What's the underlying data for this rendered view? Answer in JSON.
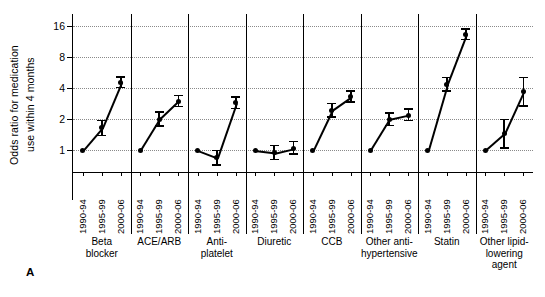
{
  "panel": {
    "letter": "A"
  },
  "chart_data": {
    "type": "line",
    "title": "",
    "xlabel": "",
    "ylabel": "Odds ratio for medication use within 4 months",
    "ylabel_lines": [
      "Odds ratio for medication",
      "use within 4 months"
    ],
    "yscale": "log",
    "ylim": [
      0.62,
      19.0
    ],
    "yticks": [
      1,
      2,
      4,
      8,
      16
    ],
    "ytick_labels": [
      "1",
      "2",
      "4",
      "8",
      "16"
    ],
    "grid": "horizontal-dotted",
    "legend": "none",
    "periods": [
      "1990-94",
      "1995-99",
      "2000-06"
    ],
    "reference_value": 1,
    "groups": [
      {
        "label": "Beta blocker",
        "label_lines": [
          "Beta",
          "blocker"
        ],
        "points": [
          {
            "period": "1990-94",
            "value": 1.0,
            "low": 1.0,
            "high": 1.0
          },
          {
            "period": "1995-99",
            "value": 1.65,
            "low": 1.4,
            "high": 1.95
          },
          {
            "period": "2000-06",
            "value": 4.55,
            "low": 4.05,
            "high": 5.15
          }
        ]
      },
      {
        "label": "ACE/ARB",
        "label_lines": [
          "ACE/ARB"
        ],
        "points": [
          {
            "period": "1990-94",
            "value": 1.0,
            "low": 1.0,
            "high": 1.0
          },
          {
            "period": "1995-99",
            "value": 2.0,
            "low": 1.72,
            "high": 2.35
          },
          {
            "period": "2000-06",
            "value": 3.0,
            "low": 2.65,
            "high": 3.4
          }
        ]
      },
      {
        "label": "Anti-platelet",
        "label_lines": [
          "Anti-",
          "platelet"
        ],
        "points": [
          {
            "period": "1990-94",
            "value": 1.0,
            "low": 1.0,
            "high": 1.0
          },
          {
            "period": "1995-99",
            "value": 0.85,
            "low": 0.72,
            "high": 1.0
          },
          {
            "period": "2000-06",
            "value": 2.9,
            "low": 2.55,
            "high": 3.3
          }
        ]
      },
      {
        "label": "Diuretic",
        "label_lines": [
          "Diuretic"
        ],
        "points": [
          {
            "period": "1990-94",
            "value": 1.0,
            "low": 1.0,
            "high": 1.0
          },
          {
            "period": "1995-99",
            "value": 0.95,
            "low": 0.82,
            "high": 1.12
          },
          {
            "period": "2000-06",
            "value": 1.05,
            "low": 0.92,
            "high": 1.22
          }
        ]
      },
      {
        "label": "CCB",
        "label_lines": [
          "CCB"
        ],
        "points": [
          {
            "period": "1990-94",
            "value": 1.0,
            "low": 1.0,
            "high": 1.0
          },
          {
            "period": "1995-99",
            "value": 2.45,
            "low": 2.1,
            "high": 2.85
          },
          {
            "period": "2000-06",
            "value": 3.3,
            "low": 2.95,
            "high": 3.75
          }
        ]
      },
      {
        "label": "Other anti-hypertensive",
        "label_lines": [
          "Other anti-",
          "hypertensive"
        ],
        "points": [
          {
            "period": "1990-94",
            "value": 1.0,
            "low": 1.0,
            "high": 1.0
          },
          {
            "period": "1995-99",
            "value": 2.0,
            "low": 1.75,
            "high": 2.3
          },
          {
            "period": "2000-06",
            "value": 2.2,
            "low": 1.95,
            "high": 2.5
          }
        ]
      },
      {
        "label": "Statin",
        "label_lines": [
          "Statin"
        ],
        "points": [
          {
            "period": "1990-94",
            "value": 1.0,
            "low": 1.0,
            "high": 1.0
          },
          {
            "period": "1995-99",
            "value": 4.35,
            "low": 3.75,
            "high": 5.05
          },
          {
            "period": "2000-06",
            "value": 13.2,
            "low": 11.8,
            "high": 14.9
          }
        ]
      },
      {
        "label": "Other lipid-lowering agent",
        "label_lines": [
          "Other lipid-",
          "lowering",
          "agent"
        ],
        "points": [
          {
            "period": "1990-94",
            "value": 1.0,
            "low": 1.0,
            "high": 1.0
          },
          {
            "period": "1995-99",
            "value": 1.45,
            "low": 1.05,
            "high": 2.0
          },
          {
            "period": "2000-06",
            "value": 3.7,
            "low": 2.7,
            "high": 5.05
          }
        ]
      }
    ]
  }
}
